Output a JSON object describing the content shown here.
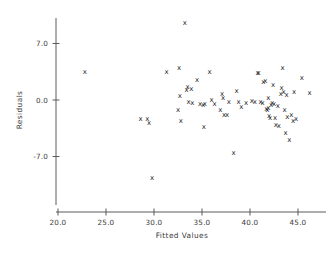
{
  "chart_data": {
    "type": "scatter",
    "title": "",
    "xlabel": "Fitted Values",
    "ylabel": "Residuals",
    "xlim": [
      20.0,
      48.5
    ],
    "ylim": [
      -11.5,
      10.5
    ],
    "xticks": [
      20.0,
      25.0,
      30.0,
      35.0,
      40.0,
      45.0
    ],
    "xtick_labels": [
      "20.0",
      "25.0",
      "30.0",
      "35.0",
      "40.0",
      "45.0"
    ],
    "yticks": [
      7.0,
      0.0,
      -7.0
    ],
    "ytick_labels": [
      "7.0",
      "0.0",
      "-7.0"
    ],
    "grid": false,
    "legend": null,
    "marker": "x",
    "marker_color": "#2a2a2a",
    "n_points": 72,
    "points": [
      {
        "x": 22.8,
        "y": 3.5
      },
      {
        "x": 28.6,
        "y": -2.3
      },
      {
        "x": 29.3,
        "y": -2.4
      },
      {
        "x": 29.5,
        "y": -2.8
      },
      {
        "x": 29.8,
        "y": -9.7
      },
      {
        "x": 31.3,
        "y": 3.5
      },
      {
        "x": 32.6,
        "y": 4.0
      },
      {
        "x": 32.5,
        "y": -1.3
      },
      {
        "x": 32.7,
        "y": 0.5
      },
      {
        "x": 32.8,
        "y": -2.6
      },
      {
        "x": 33.2,
        "y": 9.6
      },
      {
        "x": 33.4,
        "y": 1.3
      },
      {
        "x": 33.5,
        "y": 1.6
      },
      {
        "x": 33.6,
        "y": -0.3
      },
      {
        "x": 34.5,
        "y": 2.5
      },
      {
        "x": 35.1,
        "y": -0.6
      },
      {
        "x": 35.3,
        "y": -0.5
      },
      {
        "x": 35.2,
        "y": -3.3
      },
      {
        "x": 35.8,
        "y": 3.5
      },
      {
        "x": 36.0,
        "y": 0.0
      },
      {
        "x": 36.9,
        "y": -1.2
      },
      {
        "x": 37.1,
        "y": 0.8
      },
      {
        "x": 37.2,
        "y": 0.2
      },
      {
        "x": 37.3,
        "y": -1.9
      },
      {
        "x": 37.6,
        "y": -1.9
      },
      {
        "x": 37.8,
        "y": -0.2
      },
      {
        "x": 38.3,
        "y": -6.6
      },
      {
        "x": 38.6,
        "y": 1.1
      },
      {
        "x": 39.1,
        "y": -0.9
      },
      {
        "x": 40.2,
        "y": -0.1
      },
      {
        "x": 40.5,
        "y": -0.2
      },
      {
        "x": 40.8,
        "y": 3.4
      },
      {
        "x": 41.1,
        "y": -0.3
      },
      {
        "x": 41.3,
        "y": -0.4
      },
      {
        "x": 41.4,
        "y": 2.2
      },
      {
        "x": 41.6,
        "y": 2.3
      },
      {
        "x": 41.7,
        "y": -1.1
      },
      {
        "x": 41.8,
        "y": -1.3
      },
      {
        "x": 41.9,
        "y": -1.0
      },
      {
        "x": 41.9,
        "y": 0.2
      },
      {
        "x": 42.0,
        "y": -2.0
      },
      {
        "x": 42.1,
        "y": -2.2
      },
      {
        "x": 42.2,
        "y": -0.6
      },
      {
        "x": 42.3,
        "y": -0.4
      },
      {
        "x": 42.4,
        "y": 1.9
      },
      {
        "x": 42.5,
        "y": -0.5
      },
      {
        "x": 42.6,
        "y": -2.2
      },
      {
        "x": 42.7,
        "y": -3.1
      },
      {
        "x": 43.0,
        "y": -3.2
      },
      {
        "x": 43.2,
        "y": 0.8
      },
      {
        "x": 43.3,
        "y": 1.5
      },
      {
        "x": 43.4,
        "y": 4.0
      },
      {
        "x": 43.5,
        "y": 1.0
      },
      {
        "x": 43.6,
        "y": -1.2
      },
      {
        "x": 43.7,
        "y": -4.1
      },
      {
        "x": 43.8,
        "y": 0.6
      },
      {
        "x": 44.1,
        "y": -5.0
      },
      {
        "x": 44.3,
        "y": -1.9
      },
      {
        "x": 44.5,
        "y": -2.6
      },
      {
        "x": 44.6,
        "y": 1.0
      },
      {
        "x": 44.8,
        "y": -2.4
      },
      {
        "x": 45.4,
        "y": 2.7
      },
      {
        "x": 46.2,
        "y": 0.9
      },
      {
        "x": 40.9,
        "y": 3.4
      },
      {
        "x": 38.8,
        "y": -0.3
      },
      {
        "x": 36.3,
        "y": -0.5
      },
      {
        "x": 34.0,
        "y": -0.4
      },
      {
        "x": 34.8,
        "y": -0.5
      },
      {
        "x": 39.6,
        "y": -0.4
      },
      {
        "x": 42.9,
        "y": -0.7
      },
      {
        "x": 33.9,
        "y": 1.4
      },
      {
        "x": 43.9,
        "y": -2.1
      }
    ]
  },
  "labels": {
    "xaxis_title": "Fitted Values",
    "yaxis_title": "Residuals"
  }
}
